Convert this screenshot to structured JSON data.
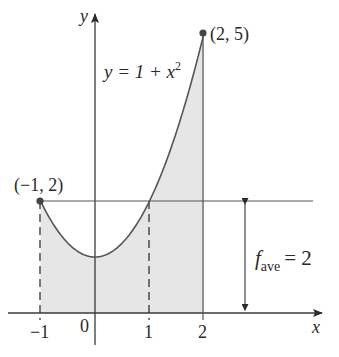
{
  "chart_data": {
    "type": "line",
    "title": "",
    "xlabel": "x",
    "ylabel": "y",
    "function": "y = 1 + x^2",
    "function_label": {
      "prefix": "y = 1 + x",
      "superscript": "2"
    },
    "x_ticks": [
      "−1",
      "0",
      "1",
      "2"
    ],
    "x_tick_values": [
      -1,
      0,
      1,
      2
    ],
    "xlim": [
      -1.2,
      4.1
    ],
    "ylim": [
      0,
      5.3
    ],
    "shaded_region": {
      "from_x": -1,
      "to_x": 2,
      "description": "area under y = 1 + x^2"
    },
    "highlighted_points": [
      {
        "x": -1,
        "y": 2,
        "label": "(−1, 2)"
      },
      {
        "x": 2,
        "y": 5,
        "label": "(2, 5)"
      }
    ],
    "horizontal_line": {
      "y": 2,
      "label_main": "f",
      "label_sub": "ave",
      "label_value": "= 2"
    },
    "dashed_verticals": [
      -1,
      1
    ],
    "series": [
      {
        "name": "y = 1 + x^2",
        "x": [
          -1,
          -0.5,
          0,
          0.5,
          1,
          1.5,
          2
        ],
        "values": [
          2,
          1.25,
          1,
          1.25,
          2,
          3.25,
          5
        ]
      }
    ],
    "grid": false,
    "legend": "none"
  },
  "labels": {
    "x_axis": "x",
    "y_axis": "y",
    "point_left": "(−1, 2)",
    "point_right": "(2, 5)",
    "func_prefix": "y = 1 + x",
    "func_sup": "2",
    "fave_main": "f",
    "fave_sub": "ave",
    "fave_value": "= 2",
    "tick_m1": "−1",
    "tick_0": "0",
    "tick_1": "1",
    "tick_2": "2"
  },
  "colors": {
    "curve": "#555555",
    "axis": "#3a3a3a",
    "fill": "#e6e6e6",
    "point": "#444444"
  }
}
